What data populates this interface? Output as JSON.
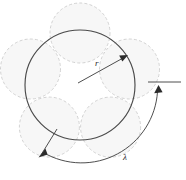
{
  "figure": {
    "background_color": "#ffffff",
    "labels": {
      "radius": "r",
      "arc": "λ"
    },
    "colors": {
      "main_circle_stroke": "#4a4a4a",
      "petal_fill": "#f4f4f4",
      "petal_stroke": "#c8c8c8",
      "annotation_stroke": "#3a3a3a",
      "arrow_fill": "#2b2b2b",
      "label_text": "#2b2b2b"
    },
    "geometry": {
      "main_circle": {
        "cx": 80,
        "cy": 85,
        "r": 55
      },
      "petal_count": 5,
      "petal_radius": 30,
      "petal_center_distance": 52,
      "petal_start_angle_deg": -90,
      "radius_arrow": {
        "from_x": 78,
        "from_y": 83,
        "to_x": 126,
        "to_y": 56
      },
      "arc_sweep": {
        "cx": 80,
        "cy": 85,
        "r": 76,
        "start_deg": 118,
        "end_deg": -8
      },
      "tick_line": {
        "x1": 148,
        "y1": 82,
        "x2": 181,
        "y2": 82
      }
    }
  }
}
